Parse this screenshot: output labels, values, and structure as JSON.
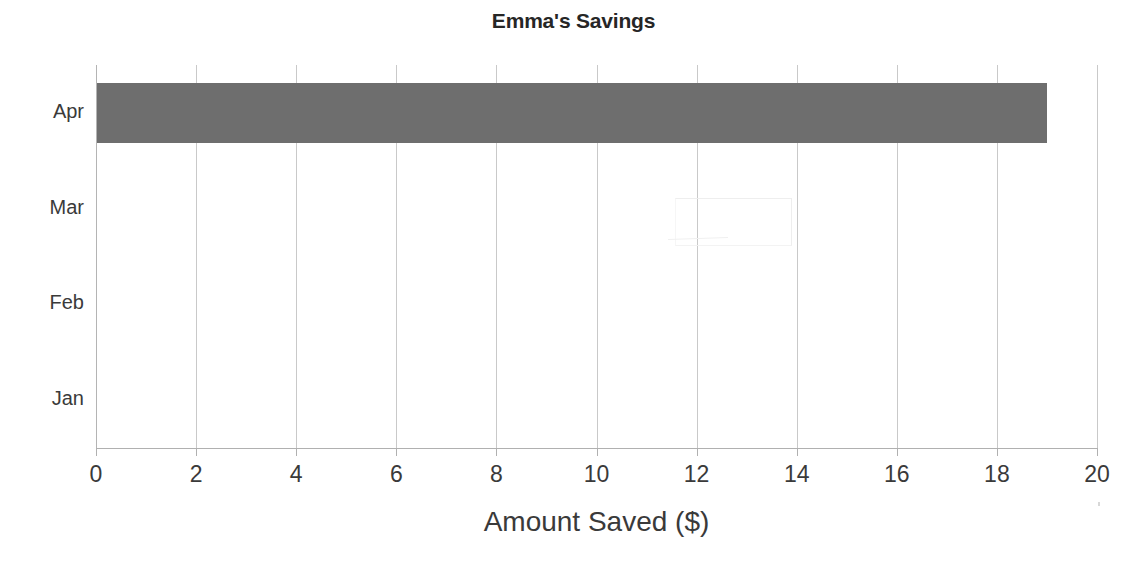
{
  "chart_data": {
    "type": "bar",
    "orientation": "horizontal",
    "title": "Emma's Savings",
    "xlabel": "Amount Saved ($)",
    "ylabel": "",
    "categories": [
      "Jan",
      "Feb",
      "Mar",
      "Apr"
    ],
    "values": [
      0,
      0,
      0,
      19
    ],
    "xlim": [
      0,
      20
    ],
    "xticks": [
      0,
      2,
      4,
      6,
      8,
      10,
      12,
      14,
      16,
      18,
      20
    ],
    "xtick_labels": [
      "0",
      "2",
      "4",
      "6",
      "8",
      "10",
      "12",
      "14",
      "16",
      "18",
      "20"
    ],
    "grid": "vertical",
    "legend": "none",
    "bar_color": "#6e6e6e",
    "gridline_color": "#c9c9c9",
    "axis_color": "#b0b0b0",
    "text_color": "#3a3a3a",
    "title_color": "#262626",
    "annotations": [
      {
        "name": "erased-pencil-outline",
        "description": "faint erased rectangle outline in the Mar row",
        "x_start": 11.6,
        "x_end": 13.9
      }
    ]
  },
  "display_order_top_to_bottom": [
    "Apr",
    "Mar",
    "Feb",
    "Jan"
  ]
}
